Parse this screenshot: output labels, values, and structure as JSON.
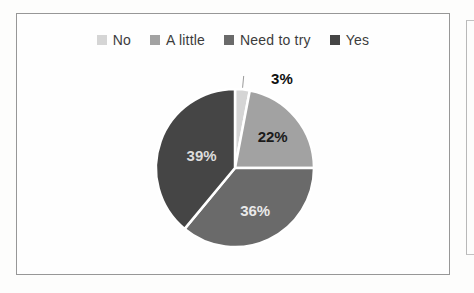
{
  "chart_data": {
    "type": "pie",
    "title": "",
    "categories": [
      "No",
      "A little",
      "Need to try",
      "Yes"
    ],
    "values": [
      3,
      22,
      36,
      39
    ],
    "data_labels": [
      "3%",
      "22%",
      "36%",
      "39%"
    ],
    "colors": [
      "#d5d5d5",
      "#a2a2a2",
      "#6a6a6a",
      "#454545"
    ],
    "data_label_colors": [
      "#101010",
      "#1b1b1b",
      "#e9e9e9",
      "#dcdcdc"
    ],
    "label_outside": [
      true,
      false,
      false,
      false
    ],
    "label_radius_frac": [
      1.2,
      0.62,
      0.6,
      0.45
    ],
    "legend_position": "top",
    "start_angle_deg": 0,
    "direction": "clockwise",
    "slice_border_color": "#ffffff",
    "leader_line_color": "#9a9a9a"
  },
  "figure": {
    "border_color": "#979797"
  }
}
